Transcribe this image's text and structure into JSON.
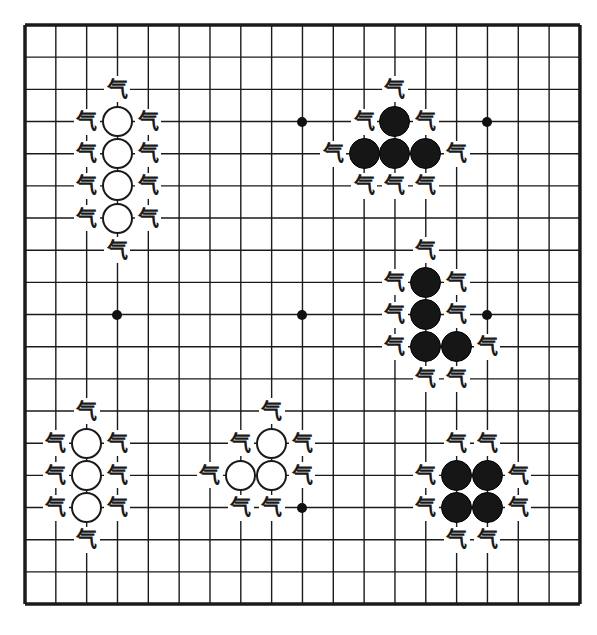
{
  "board": {
    "size": 19,
    "origin_x": 25,
    "origin_y": 25,
    "step_x": 30.83,
    "step_y": 32.17,
    "line_color": "#1a1a1a",
    "background": "#ffffff"
  },
  "liberty_label": "气",
  "star_points": [
    [
      9,
      3
    ],
    [
      15,
      3
    ],
    [
      3,
      9
    ],
    [
      9,
      9
    ],
    [
      15,
      9
    ],
    [
      9,
      15
    ]
  ],
  "groups": [
    {
      "name": "white-group-vertical-four",
      "color": "white",
      "stones": [
        [
          3,
          3
        ],
        [
          3,
          4
        ],
        [
          3,
          5
        ],
        [
          3,
          6
        ]
      ],
      "liberties": [
        [
          3,
          2
        ],
        [
          2,
          3
        ],
        [
          4,
          3
        ],
        [
          2,
          4
        ],
        [
          4,
          4
        ],
        [
          2,
          5
        ],
        [
          4,
          5
        ],
        [
          2,
          6
        ],
        [
          4,
          6
        ],
        [
          3,
          7
        ]
      ]
    },
    {
      "name": "black-group-t-shape",
      "color": "black",
      "stones": [
        [
          12,
          3
        ],
        [
          11,
          4
        ],
        [
          12,
          4
        ],
        [
          13,
          4
        ]
      ],
      "liberties": [
        [
          12,
          2
        ],
        [
          11,
          3
        ],
        [
          13,
          3
        ],
        [
          10,
          4
        ],
        [
          14,
          4
        ],
        [
          11,
          5
        ],
        [
          12,
          5
        ],
        [
          13,
          5
        ]
      ]
    },
    {
      "name": "black-group-l-shape",
      "color": "black",
      "stones": [
        [
          13,
          8
        ],
        [
          13,
          9
        ],
        [
          13,
          10
        ],
        [
          14,
          10
        ]
      ],
      "liberties": [
        [
          13,
          7
        ],
        [
          12,
          8
        ],
        [
          14,
          8
        ],
        [
          12,
          9
        ],
        [
          14,
          9
        ],
        [
          12,
          10
        ],
        [
          15,
          10
        ],
        [
          13,
          11
        ],
        [
          14,
          11
        ]
      ]
    },
    {
      "name": "white-group-vertical-three",
      "color": "white",
      "stones": [
        [
          2,
          13
        ],
        [
          2,
          14
        ],
        [
          2,
          15
        ]
      ],
      "liberties": [
        [
          2,
          12
        ],
        [
          1,
          13
        ],
        [
          3,
          13
        ],
        [
          1,
          14
        ],
        [
          3,
          14
        ],
        [
          1,
          15
        ],
        [
          3,
          15
        ],
        [
          2,
          16
        ]
      ]
    },
    {
      "name": "white-group-bent-three",
      "color": "white",
      "stones": [
        [
          8,
          13
        ],
        [
          7,
          14
        ],
        [
          8,
          14
        ]
      ],
      "liberties": [
        [
          8,
          12
        ],
        [
          7,
          13
        ],
        [
          9,
          13
        ],
        [
          6,
          14
        ],
        [
          9,
          14
        ],
        [
          7,
          15
        ],
        [
          8,
          15
        ]
      ]
    },
    {
      "name": "black-group-square",
      "color": "black",
      "stones": [
        [
          14,
          14
        ],
        [
          15,
          14
        ],
        [
          14,
          15
        ],
        [
          15,
          15
        ]
      ],
      "liberties": [
        [
          14,
          13
        ],
        [
          15,
          13
        ],
        [
          13,
          14
        ],
        [
          16,
          14
        ],
        [
          13,
          15
        ],
        [
          16,
          15
        ],
        [
          14,
          16
        ],
        [
          15,
          16
        ]
      ]
    }
  ]
}
